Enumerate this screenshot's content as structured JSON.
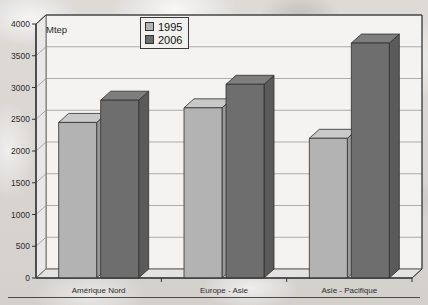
{
  "chart_data": {
    "type": "bar",
    "title": "",
    "unit_label": "Mtep",
    "xlabel": "",
    "ylabel": "Mtep",
    "categories": [
      "Amérique Nord",
      "Europe - Asie",
      "Asie - Pacifique"
    ],
    "series": [
      {
        "name": "1995",
        "color": "#b3b3b3",
        "values": [
          2450,
          2680,
          2200
        ]
      },
      {
        "name": "2006",
        "color": "#6e6e6e",
        "values": [
          2800,
          3050,
          3700
        ]
      }
    ],
    "ylim": [
      0,
      4000
    ],
    "yticks": [
      0,
      500,
      1000,
      1500,
      2000,
      2500,
      3000,
      3500,
      4000
    ],
    "ytick_labels": [
      "0",
      "500",
      "1000",
      "1500",
      "2000",
      "2500",
      "3000",
      "3500",
      "4000"
    ],
    "grid": true,
    "legend_position": "top-center",
    "three_d": true
  },
  "legend": {
    "items": [
      {
        "label": "1995",
        "color": "#b3b3b3"
      },
      {
        "label": "2006",
        "color": "#6e6e6e"
      }
    ]
  },
  "axis": {
    "unit": "Mtep"
  }
}
